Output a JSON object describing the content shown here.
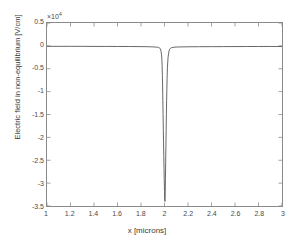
{
  "chart_data": {
    "type": "line",
    "title": "",
    "xlabel": "x [microns]",
    "ylabel": "Electric field in non-equilibrium [V/cm]",
    "y_multiplier": "×10",
    "y_multiplier_exp": "4",
    "y_multiplier_text": "×10^4",
    "xlim": [
      1,
      3
    ],
    "ylim": [
      -3.5,
      0.5
    ],
    "xticks": [
      1,
      1.2,
      1.4,
      1.6,
      1.8,
      2,
      2.2,
      2.4,
      2.6,
      2.8,
      3
    ],
    "xtick_labels": [
      "1",
      "1.2",
      "1.4",
      "1.6",
      "1.8",
      "2",
      "2.2",
      "2.4",
      "2.6",
      "2.8",
      "3"
    ],
    "yticks": [
      0.5,
      0,
      -0.5,
      -1,
      -1.5,
      -2,
      -2.5,
      -3,
      -3.5
    ],
    "ytick_labels": [
      "0.5",
      "0",
      "-0.5",
      "-1",
      "-1.5",
      "-2",
      "-2.5",
      "-3",
      "-3.5"
    ],
    "grid": false,
    "legend": null,
    "line_color": "#555555",
    "axis_color": "#8a8a8a",
    "series": [
      {
        "name": "Electric field",
        "x": [
          1.0,
          1.1,
          1.2,
          1.3,
          1.4,
          1.5,
          1.6,
          1.7,
          1.8,
          1.85,
          1.88,
          1.9,
          1.92,
          1.94,
          1.95,
          1.955,
          1.96,
          1.965,
          1.97,
          1.975,
          1.978,
          1.98,
          1.982,
          1.984,
          1.986,
          1.988,
          1.99,
          1.992,
          1.994,
          1.996,
          1.998,
          2.0,
          2.002,
          2.004,
          2.006,
          2.008,
          2.01,
          2.012,
          2.014,
          2.016,
          2.018,
          2.02,
          2.022,
          2.025,
          2.03,
          2.035,
          2.04,
          2.045,
          2.05,
          2.06,
          2.08,
          2.1,
          2.15,
          2.2,
          2.3,
          2.4,
          2.5,
          2.6,
          2.7,
          2.8,
          2.9,
          3.0
        ],
        "y": [
          -0.01,
          -0.01,
          -0.01,
          -0.01,
          -0.012,
          -0.012,
          -0.013,
          -0.014,
          -0.016,
          -0.018,
          -0.02,
          -0.022,
          -0.025,
          -0.03,
          -0.035,
          -0.04,
          -0.05,
          -0.07,
          -0.11,
          -0.2,
          -0.32,
          -0.45,
          -0.65,
          -0.9,
          -1.2,
          -1.5,
          -1.82,
          -2.12,
          -2.4,
          -2.68,
          -2.95,
          -3.18,
          -3.36,
          -3.4,
          -3.2,
          -2.9,
          -2.55,
          -2.2,
          -1.85,
          -1.5,
          -1.2,
          -0.95,
          -0.72,
          -0.48,
          -0.26,
          -0.16,
          -0.1,
          -0.07,
          -0.055,
          -0.04,
          -0.03,
          -0.025,
          -0.022,
          -0.02,
          -0.018,
          -0.017,
          -0.016,
          -0.015,
          -0.014,
          -0.014,
          -0.013,
          -0.013
        ]
      }
    ]
  },
  "axes": {
    "exponent_prefix": "×10",
    "exponent_value": "4"
  }
}
